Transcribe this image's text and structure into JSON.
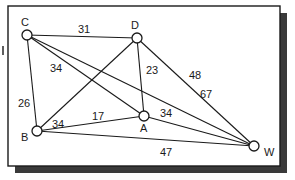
{
  "diagram": {
    "type": "weighted-graph",
    "colors": {
      "line": "#1a1a1a",
      "node_fill": "#ffffff",
      "shadow": "#3a3a3a",
      "background": "#ffffff"
    },
    "nodes": [
      {
        "id": "C",
        "label": "C"
      },
      {
        "id": "D",
        "label": "D"
      },
      {
        "id": "B",
        "label": "B"
      },
      {
        "id": "A",
        "label": "A"
      },
      {
        "id": "W",
        "label": "W"
      }
    ],
    "edges": [
      {
        "from": "C",
        "to": "D",
        "weight": "31"
      },
      {
        "from": "C",
        "to": "B",
        "weight": "26"
      },
      {
        "from": "C",
        "to": "A",
        "weight": "34"
      },
      {
        "from": "C",
        "to": "W",
        "weight": "67"
      },
      {
        "from": "D",
        "to": "B",
        "weight": "34"
      },
      {
        "from": "D",
        "to": "A",
        "weight": "23"
      },
      {
        "from": "D",
        "to": "W",
        "weight": "48"
      },
      {
        "from": "B",
        "to": "A",
        "weight": "17"
      },
      {
        "from": "B",
        "to": "W",
        "weight": "47"
      },
      {
        "from": "A",
        "to": "W",
        "weight": "34"
      }
    ]
  }
}
